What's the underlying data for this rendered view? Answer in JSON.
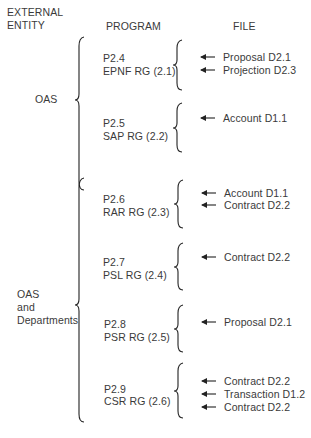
{
  "headers": {
    "external_entity": [
      "EXTERNAL",
      "ENTITY"
    ],
    "program": "PROGRAM",
    "file": "FILE"
  },
  "entities": [
    {
      "label_lines": [
        "OAS"
      ]
    },
    {
      "label_lines": [
        "OAS",
        "and",
        "Departments"
      ]
    }
  ],
  "programs": [
    {
      "id": "P2.4",
      "name": "EPNF RG (2.1)",
      "files": [
        "Proposal D2.1",
        "Projection D2.3"
      ]
    },
    {
      "id": "P2.5",
      "name": "SAP RG (2.2)",
      "files": [
        "Account D1.1"
      ]
    },
    {
      "id": "P2.6",
      "name": "RAR RG (2.3)",
      "files": [
        "Account D1.1",
        "Contract D2.2"
      ]
    },
    {
      "id": "P2.7",
      "name": "PSL RG (2.4)",
      "files": [
        "Contract D2.2"
      ]
    },
    {
      "id": "P2.8",
      "name": "PSR RG (2.5)",
      "files": [
        "Proposal D2.1"
      ]
    },
    {
      "id": "P2.9",
      "name": "CSR RG (2.6)",
      "files": [
        "Contract D2.2",
        "Transaction D1.2",
        "Contract D2.2"
      ]
    }
  ],
  "colors": {
    "ink": "#3a3a3a",
    "line": "#222222"
  }
}
